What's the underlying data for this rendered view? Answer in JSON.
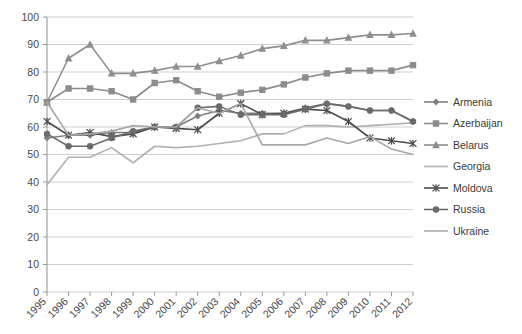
{
  "chart_data": {
    "type": "line",
    "title": "",
    "subtitle": "",
    "xlabel": "",
    "ylabel": "",
    "grid": true,
    "legend_position": "right",
    "ylim": [
      0,
      100
    ],
    "ytick_step": 10,
    "yticks": [
      "0",
      "10",
      "20",
      "30",
      "40",
      "50",
      "60",
      "70",
      "80",
      "90",
      "100"
    ],
    "categories": [
      "1995",
      "1996",
      "1997",
      "1998",
      "1999",
      "2000",
      "2001",
      "2002",
      "2003",
      "2004",
      "2005",
      "2006",
      "2007",
      "2008",
      "2009",
      "2010",
      "2011",
      "2012"
    ],
    "series": [
      {
        "name": "Armenia",
        "marker": "diamond",
        "color": "#808080",
        "values": [
          56,
          57,
          57,
          58,
          58,
          60,
          60,
          64,
          66,
          65,
          65,
          65,
          67,
          68.5,
          67.5,
          66,
          66,
          62
        ]
      },
      {
        "name": "Azerbaijan",
        "marker": "square",
        "color": "#8c8c8c",
        "values": [
          69,
          74,
          74,
          73,
          70,
          76,
          77,
          73,
          71,
          72.5,
          73.5,
          75.5,
          78,
          79.5,
          80.5,
          80.5,
          80.5,
          82.5
        ]
      },
      {
        "name": "Belarus",
        "marker": "triangle",
        "color": "#8f8f8f",
        "values": [
          69,
          85,
          90,
          79.5,
          79.5,
          80.5,
          82,
          82,
          84,
          86,
          88.5,
          89.5,
          91.5,
          91.5,
          92.5,
          93.5,
          93.5,
          94
        ]
      },
      {
        "name": "Georgia",
        "marker": "none",
        "color": "#b0b0b0",
        "values": [
          39,
          49,
          49,
          52.5,
          47,
          53,
          52.5,
          53,
          54,
          55,
          57.5,
          57.5,
          60.5,
          60.5,
          60,
          60.5,
          61,
          61.5
        ]
      },
      {
        "name": "Moldova",
        "marker": "star",
        "color": "#4d4d4d",
        "values": [
          62,
          57,
          58,
          56.5,
          57.5,
          60,
          59.5,
          59,
          65,
          68.5,
          64.5,
          65,
          66.5,
          66,
          62,
          56,
          55,
          54
        ]
      },
      {
        "name": "Russia",
        "marker": "circle",
        "color": "#6b6b6b",
        "values": [
          57.5,
          53,
          53,
          56,
          58.5,
          60,
          60,
          67,
          67.5,
          64.5,
          64.5,
          64.5,
          66.5,
          68.5,
          67.5,
          66,
          66,
          62
        ]
      },
      {
        "name": "Ukraine",
        "marker": "none",
        "color": "#a8a8a8",
        "values": [
          69,
          57,
          57.5,
          58.5,
          60.5,
          60,
          60,
          67,
          65,
          68.5,
          53.5,
          53.5,
          53.5,
          56,
          54,
          56.5,
          52,
          50
        ]
      }
    ]
  },
  "legend": {
    "entries": [
      {
        "label": "Armenia"
      },
      {
        "label": "Azerbaijan"
      },
      {
        "label": "Belarus"
      },
      {
        "label": "Georgia"
      },
      {
        "label": "Moldova"
      },
      {
        "label": "Russia"
      },
      {
        "label": "Ukraine"
      }
    ]
  }
}
